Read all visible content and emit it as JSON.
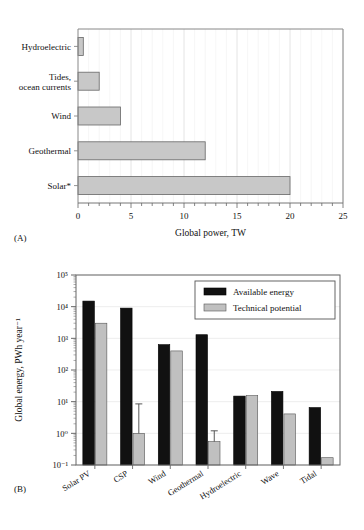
{
  "figure": {
    "panel_a_label": "(A)",
    "panel_b_label": "(B)"
  },
  "chart_data": [
    {
      "id": "panel-a",
      "type": "bar",
      "orientation": "horizontal",
      "title": "",
      "xlabel": "Global power, TW",
      "ylabel": "",
      "xlim": [
        0,
        25
      ],
      "xticks": [
        0,
        5,
        10,
        15,
        20,
        25
      ],
      "xticklabels": [
        "0",
        "5",
        "10",
        "15",
        "20",
        "25"
      ],
      "minor_ticks": true,
      "grid": "vertical",
      "categories": [
        "Hydroelectric",
        "Tides, ocean currents",
        "Wind",
        "Geothermal",
        "Solar*"
      ],
      "values": [
        0.5,
        2,
        4,
        12,
        20
      ],
      "bar_fill": "#c8c8c8",
      "bar_edge": "#666666",
      "legend": null
    },
    {
      "id": "panel-b",
      "type": "bar",
      "orientation": "vertical",
      "title": "",
      "xlabel": "",
      "ylabel": "Global energy, PWh year⁻¹",
      "yscale": "log",
      "ylim": [
        0.1,
        100000
      ],
      "yticks": [
        0.1,
        1,
        10,
        100,
        1000,
        10000,
        100000
      ],
      "yticklabels": [
        "10⁻¹",
        "10⁰",
        "10¹",
        "10²",
        "10³",
        "10⁴",
        "10⁵"
      ],
      "grid": "horizontal",
      "categories": [
        "Solar PV",
        "CSP",
        "Wind",
        "Geothermal",
        "Hydroelectric",
        "Wave",
        "Tidal"
      ],
      "series": [
        {
          "name": "Available energy",
          "color": "#111111",
          "values": [
            15000,
            9000,
            630,
            1300,
            15,
            21,
            6.5
          ],
          "errors": [
            null,
            null,
            null,
            null,
            null,
            null,
            null
          ]
        },
        {
          "name": "Technical potential",
          "color": "#c0c0c0",
          "values": [
            3000,
            1.0,
            400,
            0.55,
            15.5,
            4.1,
            0.17
          ],
          "errors": [
            null,
            8.5,
            null,
            1.2,
            null,
            null,
            null
          ]
        }
      ],
      "legend": {
        "position": "upper right",
        "entries": [
          "Available energy",
          "Technical potential"
        ]
      }
    }
  ]
}
